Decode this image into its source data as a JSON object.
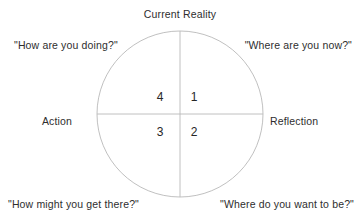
{
  "diagram": {
    "title": "Current Reality",
    "type": "coaching-cycle-quadrant",
    "background_color": "#ffffff",
    "line_color": "#b9b9b9",
    "text_color": "#2e2e2e",
    "axes": {
      "top_label": "Current Reality",
      "left_label": "Action",
      "right_label": "Reflection"
    },
    "circle": {
      "center_x": 180,
      "center_y": 114,
      "radius": 83,
      "stroke_width": 0.9
    },
    "quadrants": [
      {
        "number": "1",
        "position": "top-right",
        "question": "\"Where are you now?\""
      },
      {
        "number": "2",
        "position": "bottom-right",
        "question": "\"Where do you want to be?\""
      },
      {
        "number": "3",
        "position": "bottom-left",
        "question": "\"How might you get there?\""
      },
      {
        "number": "4",
        "position": "top-left",
        "question": "\"How are you doing?\""
      }
    ],
    "corner_questions": {
      "top_left": "\"How are you doing?\"",
      "top_right": "\"Where are you now?\"",
      "bottom_left": "\"How might you get there?\"",
      "bottom_right": "\"Where do you want to be?\""
    }
  }
}
